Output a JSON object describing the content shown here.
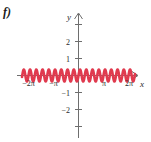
{
  "figure": {
    "part_label": "f)",
    "axis_color": "#6e6e6e",
    "curve_color": "#e03a4e",
    "background": "#ffffff"
  },
  "axes": {
    "x_axis_name": "x",
    "y_axis_name": "y",
    "x_arrow": "arrow-right",
    "y_arrow": "arrow-up"
  },
  "labels": {
    "x_neg_2pi": "−2π",
    "x_neg_pi": "−π",
    "x_pi": "π",
    "x_2pi": "2π",
    "y_2": "2",
    "y_1": "1",
    "y_neg_1": "−1",
    "y_neg_2": "−2"
  },
  "chart_data": {
    "type": "line",
    "title": "",
    "xlabel": "x",
    "ylabel": "y",
    "grid": false,
    "legend": null,
    "xlim": [
      -7.5,
      7.5
    ],
    "ylim": [
      -2.9,
      2.9
    ],
    "xticks": [
      -6.283185,
      -3.141593,
      3.141593,
      6.283185
    ],
    "xticklabels": [
      "−2π",
      "−π",
      "π",
      "2π"
    ],
    "yticks": [
      -2,
      -1,
      1,
      2
    ],
    "yticklabels": [
      "−2",
      "−1",
      "1",
      "2"
    ],
    "series": [
      {
        "name": "y = 0.35 sin(8x)",
        "amplitude": 0.35,
        "frequency": 8,
        "phase": 0,
        "color": "#e03a4e",
        "x_start": -7.1,
        "x_end": 7.1,
        "cycles_visible": 18
      }
    ]
  }
}
